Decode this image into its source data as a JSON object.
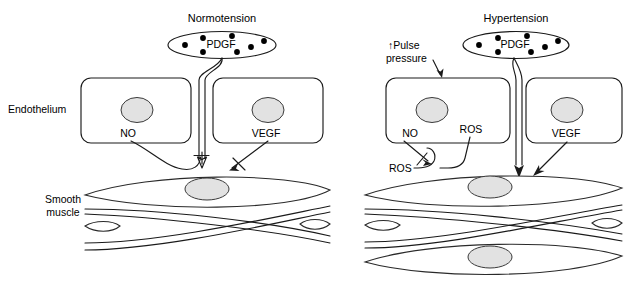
{
  "figure": {
    "background_color": "#ffffff",
    "line_color": "#1a1a1a",
    "nucleus_fill": "#e2e2e2",
    "dot_color": "#000000"
  },
  "side_labels": {
    "endothelium": "Endothelium",
    "smooth_muscle_line1": "Smooth",
    "smooth_muscle_line2": "muscle"
  },
  "panels": [
    {
      "id": "normotension",
      "title": "Normotension",
      "lumen_label": "PDGF",
      "platelet_count": 7,
      "endothelial_cells": [
        {
          "id": "left-cell",
          "label": "NO"
        },
        {
          "id": "right-cell",
          "label": "VEGF"
        }
      ],
      "pulse_pressure_label": null,
      "ros_labels": [],
      "smooth_muscle_layers": 2,
      "signals": [
        {
          "from": "PDGF",
          "to": "smooth-muscle",
          "type": "arrow"
        },
        {
          "from": "NO",
          "to": "PDGF-signal",
          "type": "inhibition"
        },
        {
          "from": "VEGF",
          "to": "smooth-muscle",
          "type": "arrow-blocked"
        }
      ]
    },
    {
      "id": "hypertension",
      "title": "Hypertension",
      "lumen_label": "PDGF",
      "platelet_count": 7,
      "endothelial_cells": [
        {
          "id": "left-cell",
          "label": "NO"
        },
        {
          "id": "right-cell",
          "label": "VEGF"
        }
      ],
      "pulse_pressure_label": "↑Pulse\npressure",
      "pulse_pressure_line1": "↑Pulse",
      "pulse_pressure_line2": "pressure",
      "ros_labels": [
        "ROS",
        "ROS"
      ],
      "ros_inside_cell": "ROS",
      "ros_outside_cell": "ROS",
      "smooth_muscle_layers": 3,
      "signals": [
        {
          "from": "PDGF",
          "to": "smooth-muscle",
          "type": "arrow"
        },
        {
          "from": "NO",
          "to": "ROS",
          "type": "arrow-blocked"
        },
        {
          "from": "VEGF",
          "to": "smooth-muscle",
          "type": "arrow"
        },
        {
          "from": "pulse-pressure",
          "to": "endothelium",
          "type": "arrow"
        }
      ]
    }
  ]
}
